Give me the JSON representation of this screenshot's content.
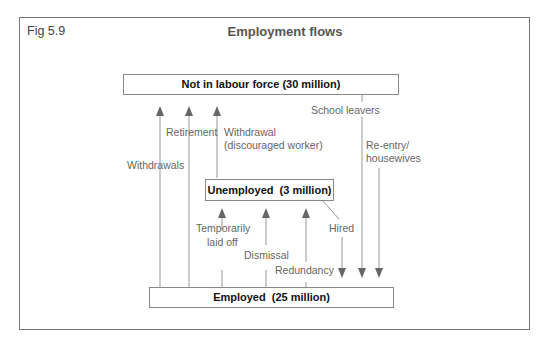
{
  "figure": {
    "label": "Fig 5.9",
    "title": "Employment flows"
  },
  "nodes": {
    "not_in_labour_force": "Not in labour force (30 million)",
    "unemployed": "Unemployed  (3 million)",
    "employed": "Employed  (25 million)"
  },
  "flows": {
    "withdrawals": "Withdrawals",
    "retirement": "Retirement",
    "withdrawal_line1": "Withdrawal",
    "withdrawal_line2": "(discouraged worker)",
    "school_leavers": "School leavers",
    "reentry_line1": "Re-entry/",
    "reentry_line2": "housewives",
    "temporarily_line1": "Temporarily",
    "temporarily_line2": "laid off",
    "dismissal": "Dismissal",
    "redundancy": "Redundancy",
    "hired": "Hired"
  },
  "colors": {
    "line": "#888888",
    "arrow": "#666666",
    "box_border": "#888888",
    "frame": "#777777"
  }
}
